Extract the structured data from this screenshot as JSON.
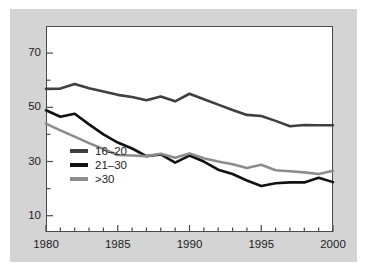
{
  "chart_data": {
    "type": "line",
    "title": "",
    "xlabel": "",
    "ylabel": "",
    "xlim": [
      1980,
      2000
    ],
    "ylim": [
      4,
      80
    ],
    "grid": false,
    "legend_position": "inside-lower-left",
    "x": [
      1980,
      1981,
      1982,
      1983,
      1984,
      1985,
      1986,
      1987,
      1988,
      1989,
      1990,
      1991,
      1992,
      1993,
      1994,
      1995,
      1996,
      1997,
      1998,
      1999,
      2000
    ],
    "xticks": [
      1980,
      1981,
      1982,
      1983,
      1984,
      1985,
      1986,
      1987,
      1988,
      1989,
      1990,
      1991,
      1992,
      1993,
      1994,
      1995,
      1996,
      1997,
      1998,
      1999,
      2000
    ],
    "xticklabels": [
      "1980",
      "",
      "",
      "",
      "",
      "1985",
      "",
      "",
      "",
      "",
      "1990",
      "",
      "",
      "",
      "",
      "1995",
      "",
      "",
      "",
      "",
      "2000"
    ],
    "yticks": [
      10,
      20,
      30,
      40,
      50,
      60,
      70
    ],
    "yticklabels": [
      "10",
      "",
      "30",
      "",
      "50",
      "",
      "70"
    ],
    "series": [
      {
        "name": "16-20",
        "color": "#3f3f3f",
        "values": [
          56.8,
          56.9,
          58.6,
          57.0,
          55.8,
          54.6,
          53.8,
          52.6,
          54.0,
          52.2,
          55.0,
          53.0,
          51.0,
          49.0,
          47.2,
          46.8,
          45.0,
          43.0,
          43.5,
          43.4,
          43.4
        ]
      },
      {
        "name": "21-30",
        "color": "#111111",
        "values": [
          48.9,
          46.5,
          47.6,
          43.7,
          40.0,
          37.0,
          34.8,
          32.0,
          32.6,
          29.6,
          32.2,
          30.0,
          27.0,
          25.4,
          23.0,
          21.0,
          22.0,
          22.3,
          22.3,
          24.0,
          22.4
        ]
      },
      {
        "name": ">30",
        "color": "#8c8c8c",
        "values": [
          44.0,
          41.5,
          39.2,
          36.8,
          34.6,
          32.4,
          32.2,
          32.0,
          32.9,
          31.4,
          33.0,
          31.2,
          30.0,
          29.0,
          27.6,
          28.8,
          26.8,
          26.4,
          26.0,
          25.4,
          26.6
        ]
      }
    ]
  },
  "axes": {
    "y_labels": [
      {
        "text": "70",
        "value": 70
      },
      {
        "text": "50",
        "value": 50
      },
      {
        "text": "30",
        "value": 30
      },
      {
        "text": "10",
        "value": 10
      }
    ],
    "x_labels": [
      {
        "text": "1980",
        "value": 1980
      },
      {
        "text": "1985",
        "value": 1985
      },
      {
        "text": "1990",
        "value": 1990
      },
      {
        "text": "1995",
        "value": 1995
      },
      {
        "text": "2000",
        "value": 2000
      }
    ]
  },
  "legend": {
    "items": [
      {
        "label": "16–20",
        "color": "#3f3f3f"
      },
      {
        "label": "21–30",
        "color": "#111111"
      },
      {
        "label": ">30",
        "color": "#8c8c8c"
      }
    ]
  },
  "colors": {
    "figure_background": "#d4d4d4",
    "plot_background": "#ffffff",
    "axis": "#4a4a4a",
    "text": "#1c1c1c"
  }
}
